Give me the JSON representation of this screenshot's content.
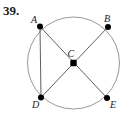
{
  "figure": {
    "problem_number": "39.",
    "type": "circle-with-inscribed-chords",
    "canvas": {
      "width": 129,
      "height": 115
    },
    "colors": {
      "stroke": "#4d4d4d",
      "circle_stroke": "#8c8c8c",
      "point_fill": "#000000",
      "text": "#1a1a1a",
      "background": "#ffffff"
    },
    "circle": {
      "name": "main-circle",
      "cx": 73.5,
      "cy": 63,
      "r": 46,
      "stroke_width": 0.9
    },
    "points": [
      {
        "id": "A",
        "label": "A",
        "x": 40,
        "y": 26.5,
        "r": 3.0,
        "label_dx": -9,
        "label_dy": -12
      },
      {
        "id": "B",
        "label": "B",
        "x": 108,
        "y": 27,
        "r": 3.0,
        "label_dx": -4,
        "label_dy": -13
      },
      {
        "id": "C",
        "label": "C",
        "x": 73.5,
        "y": 63,
        "r": 3.2,
        "label_dx": -6,
        "label_dy": -14
      },
      {
        "id": "D",
        "label": "D",
        "x": 41,
        "y": 97.5,
        "r": 3.0,
        "label_dx": -9,
        "label_dy": 2
      },
      {
        "id": "E",
        "label": "E",
        "x": 107,
        "y": 98,
        "r": 3.0,
        "label_dx": 3,
        "label_dy": 2
      }
    ],
    "segments": [
      {
        "name": "chord-A-E",
        "from": "A",
        "to": "E",
        "through": "C",
        "stroke_width": 0.9
      },
      {
        "name": "chord-B-D",
        "from": "B",
        "to": "D",
        "through": "C",
        "stroke_width": 0.9
      },
      {
        "name": "chord-A-D",
        "from": "A",
        "to": "D",
        "through": null,
        "stroke_width": 0.9
      }
    ],
    "labels": {
      "A": "A",
      "B": "B",
      "C": "C",
      "D": "D",
      "E": "E"
    }
  }
}
